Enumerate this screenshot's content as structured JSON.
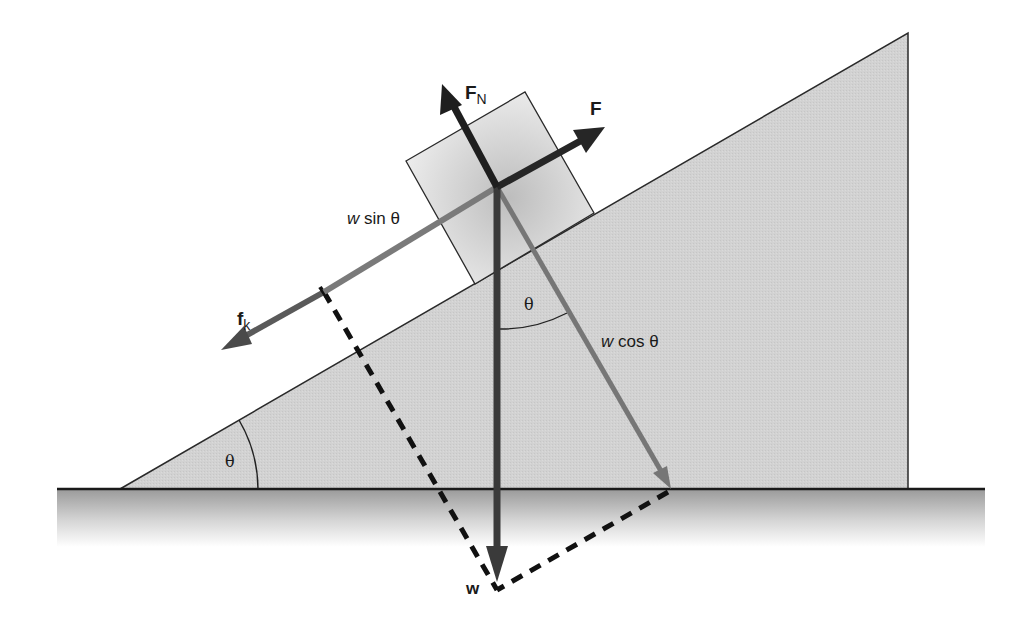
{
  "figure": {
    "colors": {
      "wedge_fill": "#d2d2d2",
      "block_fill": "#e4e4e4",
      "outline": "#2a2a2a",
      "force_dark": "#262626",
      "force_gray": "#6e6e6e",
      "ground_top": "#9a9a9a",
      "ground_bottom": "#ffffff",
      "dashes": "#111111"
    },
    "labels": {
      "normal_force": "F",
      "normal_force_sub": "N",
      "applied_force": "F",
      "friction": "f",
      "friction_sub": "k",
      "w_sin_w": "w",
      "w_sin_rest": " sin θ",
      "w_cos_w": "w",
      "w_cos_rest": " cos θ",
      "weight": "w",
      "theta_incline": "θ",
      "theta_vertical": "θ"
    },
    "vectors": [
      {
        "name": "normal-force",
        "label": "F_N",
        "from": [
          497,
          187
        ],
        "to": [
          442,
          84
        ]
      },
      {
        "name": "applied-force",
        "label": "F",
        "from": [
          497,
          187
        ],
        "to": [
          605,
          127
        ]
      },
      {
        "name": "friction",
        "label": "f_k",
        "from": [
          324,
          292
        ],
        "to": [
          221,
          350
        ]
      },
      {
        "name": "w-sin-theta",
        "label": "w sin θ",
        "from": [
          497,
          187
        ],
        "to": [
          324,
          292
        ]
      },
      {
        "name": "w-cos-theta",
        "label": "w cos θ",
        "from": [
          497,
          187
        ],
        "to": [
          671,
          489
        ]
      },
      {
        "name": "weight",
        "label": "w",
        "from": [
          497,
          187
        ],
        "to": [
          497,
          582
        ]
      }
    ],
    "incline_angle_deg": 30
  }
}
